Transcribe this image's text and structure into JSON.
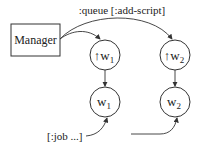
{
  "diagram": {
    "manager": {
      "label": "Manager"
    },
    "edge_label_top": ":queue [:add-script]",
    "nodes": [
      {
        "id": "up-w1",
        "arrow": "↑",
        "letter": "w",
        "sub": "1"
      },
      {
        "id": "w1",
        "letter": "w",
        "sub": "1"
      },
      {
        "id": "up-w2",
        "arrow": "↑",
        "letter": "w",
        "sub": "2"
      },
      {
        "id": "w2",
        "letter": "w",
        "sub": "2"
      }
    ],
    "input_label": "[:job ...]",
    "colors": {
      "stroke": "#333333",
      "text": "#222222",
      "background": "#ffffff"
    }
  }
}
